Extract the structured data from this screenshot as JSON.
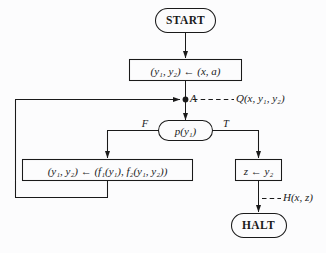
{
  "diagram": {
    "background_color": "#fcfcfd",
    "stroke_color": "#1a1a1a",
    "nodes": {
      "start": {
        "label": "START",
        "shape": "rounded-terminal"
      },
      "init": {
        "label": "(y₁, y₂) ← (x, a)",
        "shape": "rectangle"
      },
      "junction": {
        "label": "A",
        "shape": "dot"
      },
      "test": {
        "label": "p(y₁)",
        "shape": "rounded-decision"
      },
      "update": {
        "label": "(y₁, y₂) ← (f₁(y₁), f₂(y₁, y₂))",
        "shape": "rectangle"
      },
      "output": {
        "label": "z ← y₂",
        "shape": "rectangle"
      },
      "halt": {
        "label": "HALT",
        "shape": "rounded-terminal"
      }
    },
    "branch_labels": {
      "false": "F",
      "true": "T"
    },
    "assertions": {
      "invariant": "Q(x, y₁, y₂)",
      "postcondition": "H(x, z)"
    }
  }
}
